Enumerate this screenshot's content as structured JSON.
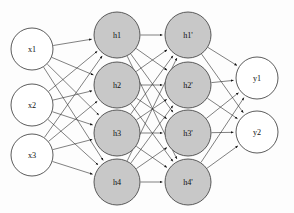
{
  "diagram": {
    "type": "neural-network",
    "background_color": "#fdfdfd",
    "edge_color": "#2b2b2b",
    "node_stroke_color": "#4a4a4a",
    "input_fill": "#ffffff",
    "hidden_fill": "#c8c8c8",
    "output_fill": "#ffffff",
    "edge_style": "directed-arrow",
    "connectivity": "fully-connected between consecutive layers",
    "layers": [
      {
        "name": "input-layer",
        "kind": "input",
        "fill": "#ffffff",
        "radius": 21,
        "cx": 32,
        "nodes": [
          {
            "id": "x1",
            "label": "x1",
            "cx": 32,
            "cy": 49
          },
          {
            "id": "x2",
            "label": "x2",
            "cx": 32,
            "cy": 105
          },
          {
            "id": "x3",
            "label": "x3",
            "cx": 32,
            "cy": 155
          }
        ]
      },
      {
        "name": "hidden-layer-1",
        "kind": "hidden",
        "fill": "#c8c8c8",
        "radius": 23,
        "cx": 117,
        "nodes": [
          {
            "id": "h1",
            "label": "h1",
            "cx": 117,
            "cy": 35
          },
          {
            "id": "h2",
            "label": "h2",
            "cx": 117,
            "cy": 85
          },
          {
            "id": "h3",
            "label": "h3",
            "cx": 117,
            "cy": 133
          },
          {
            "id": "h4",
            "label": "h4",
            "cx": 117,
            "cy": 182
          }
        ]
      },
      {
        "name": "hidden-layer-2",
        "kind": "hidden",
        "fill": "#c8c8c8",
        "radius": 23,
        "cx": 188,
        "nodes": [
          {
            "id": "h1p",
            "label": "h1'",
            "cx": 188,
            "cy": 35
          },
          {
            "id": "h2p",
            "label": "h2'",
            "cx": 188,
            "cy": 85
          },
          {
            "id": "h3p",
            "label": "h3'",
            "cx": 188,
            "cy": 133
          },
          {
            "id": "h4p",
            "label": "h4'",
            "cx": 188,
            "cy": 182
          }
        ]
      },
      {
        "name": "output-layer",
        "kind": "output",
        "fill": "#ffffff",
        "radius": 21,
        "cx": 257,
        "nodes": [
          {
            "id": "y1",
            "label": "y1",
            "cx": 257,
            "cy": 78
          },
          {
            "id": "y2",
            "label": "y2",
            "cx": 257,
            "cy": 132
          }
        ]
      }
    ],
    "edge_groups": [
      {
        "from_layer": 0,
        "to_layer": 1,
        "count": 12
      },
      {
        "from_layer": 1,
        "to_layer": 2,
        "count": 16
      },
      {
        "from_layer": 2,
        "to_layer": 3,
        "count": 8
      }
    ]
  }
}
